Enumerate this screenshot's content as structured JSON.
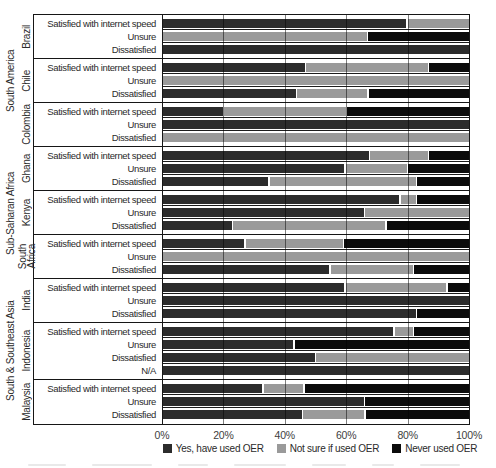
{
  "x_axis": {
    "ticks": [
      "0%",
      "20%",
      "40%",
      "60%",
      "80%",
      "100%"
    ]
  },
  "legend": [
    {
      "key": "yes",
      "label": "Yes, have used OER",
      "color": "#2c2c2c"
    },
    {
      "key": "not_sure",
      "label": "Not sure if used OER",
      "color": "#9a9a9a"
    },
    {
      "key": "never",
      "label": "Never used OER",
      "color": "#0b0b0b"
    }
  ],
  "chart_data": {
    "type": "bar",
    "variant": "horizontal-stacked-percent",
    "xlim": [
      0,
      100
    ],
    "x_tick_labels": [
      "0%",
      "20%",
      "40%",
      "60%",
      "80%",
      "100%"
    ],
    "grid": "vertical-lines-every-20pct",
    "legend_position": "bottom-center",
    "series_names": [
      "Yes, have used OER",
      "Not sure if used OER",
      "Never used OER"
    ],
    "colors": {
      "yes": "#2c2c2c",
      "not_sure": "#9a9a9a",
      "never": "#0b0b0b"
    },
    "row_labels_note": "values are percent of respondents",
    "regions": [
      {
        "name": "South America",
        "countries": [
          {
            "name": "Brazil",
            "name_lines": [
              "Brazil"
            ],
            "rows": [
              {
                "label": "Satisfied with internet speed",
                "yes": 80,
                "not_sure": 20,
                "never": 0
              },
              {
                "label": "Unsure",
                "yes": 0,
                "not_sure": 67,
                "never": 33
              },
              {
                "label": "Dissatisfied",
                "yes": 100,
                "not_sure": 0,
                "never": 0
              }
            ]
          },
          {
            "name": "Chile",
            "name_lines": [
              "Chile"
            ],
            "rows": [
              {
                "label": "Satisfied with internet speed",
                "yes": 47,
                "not_sure": 40,
                "never": 13
              },
              {
                "label": "Unsure",
                "yes": 0,
                "not_sure": 100,
                "never": 0
              },
              {
                "label": "Dissatisfied",
                "yes": 44,
                "not_sure": 23,
                "never": 33
              }
            ]
          },
          {
            "name": "Colombia",
            "name_lines": [
              "Colombia"
            ],
            "rows": [
              {
                "label": "Satisfied with internet speed",
                "yes": 20,
                "not_sure": 40,
                "never": 40
              },
              {
                "label": "Unsure",
                "yes": 100,
                "not_sure": 0,
                "never": 0
              },
              {
                "label": "Dissatisfied",
                "yes": 0,
                "not_sure": 100,
                "never": 0
              }
            ]
          }
        ]
      },
      {
        "name": "Sub-Saharan Africa",
        "countries": [
          {
            "name": "Ghana",
            "name_lines": [
              "Ghana"
            ],
            "rows": [
              {
                "label": "Satisfied with internet speed",
                "yes": 68,
                "not_sure": 19,
                "never": 13
              },
              {
                "label": "Unsure",
                "yes": 60,
                "not_sure": 20,
                "never": 20
              },
              {
                "label": "Dissatisfied",
                "yes": 35,
                "not_sure": 48,
                "never": 17
              }
            ]
          },
          {
            "name": "Kenya",
            "name_lines": [
              "Kenya"
            ],
            "rows": [
              {
                "label": "Satisfied with internet speed",
                "yes": 78,
                "not_sure": 5,
                "never": 17
              },
              {
                "label": "Unsure",
                "yes": 66,
                "not_sure": 34,
                "never": 0
              },
              {
                "label": "Dissatisfied",
                "yes": 23,
                "not_sure": 50,
                "never": 27
              }
            ]
          },
          {
            "name": "South Africa",
            "name_lines": [
              "South",
              "Africa"
            ],
            "rows": [
              {
                "label": "Satisfied with internet speed",
                "yes": 27,
                "not_sure": 32,
                "never": 41
              },
              {
                "label": "Unsure",
                "yes": 0,
                "not_sure": 100,
                "never": 0
              },
              {
                "label": "Dissatisfied",
                "yes": 55,
                "not_sure": 27,
                "never": 18
              }
            ]
          }
        ]
      },
      {
        "name": "South & Southeast Asia",
        "countries": [
          {
            "name": "India",
            "name_lines": [
              "India"
            ],
            "rows": [
              {
                "label": "Satisfied with internet speed",
                "yes": 60,
                "not_sure": 33,
                "never": 7
              },
              {
                "label": "Unsure",
                "yes": 100,
                "not_sure": 0,
                "never": 0
              },
              {
                "label": "Dissatisfied",
                "yes": 83,
                "not_sure": 0,
                "never": 17
              }
            ]
          },
          {
            "name": "Indonesia",
            "name_lines": [
              "Indonesia"
            ],
            "rows": [
              {
                "label": "Satisfied with internet speed",
                "yes": 76,
                "not_sure": 6,
                "never": 18
              },
              {
                "label": "Unsure",
                "yes": 43,
                "not_sure": 0,
                "never": 57
              },
              {
                "label": "Dissatisfied",
                "yes": 50,
                "not_sure": 50,
                "never": 0
              },
              {
                "label": "N/A",
                "yes": 100,
                "not_sure": 0,
                "never": 0
              }
            ]
          },
          {
            "name": "Malaysia",
            "name_lines": [
              "Malaysia"
            ],
            "rows": [
              {
                "label": "Satisfied with internet speed",
                "yes": 33,
                "not_sure": 13,
                "never": 54
              },
              {
                "label": "Unsure",
                "yes": 66,
                "not_sure": 0,
                "never": 34
              },
              {
                "label": "Dissatisfied",
                "yes": 46,
                "not_sure": 20,
                "never": 34
              }
            ]
          }
        ]
      }
    ]
  }
}
